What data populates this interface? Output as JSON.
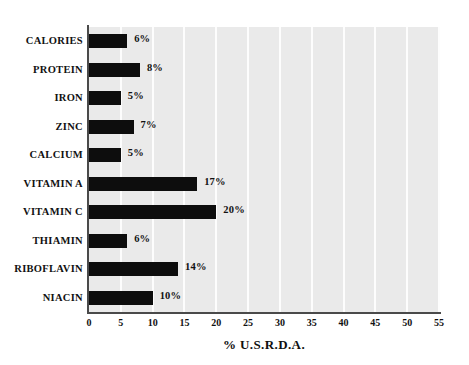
{
  "chart_data": {
    "type": "bar",
    "orientation": "horizontal",
    "title": "",
    "xlabel": "% U.S.R.D.A.",
    "ylabel": "",
    "xlim": [
      0,
      55
    ],
    "xticks": [
      "0",
      "5",
      "10",
      "15",
      "20",
      "25",
      "30",
      "35",
      "40",
      "45",
      "50",
      "55"
    ],
    "xtick_values": [
      0,
      5,
      10,
      15,
      20,
      25,
      30,
      35,
      40,
      45,
      50,
      55
    ],
    "grid": true,
    "grid_axis": "x",
    "legend": false,
    "categories": [
      "CALORIES",
      "PROTEIN",
      "IRON",
      "ZINC",
      "CALCIUM",
      "VITAMIN A",
      "VITAMIN C",
      "THIAMIN",
      "RIBOFLAVIN",
      "NIACIN"
    ],
    "values": [
      6,
      8,
      5,
      7,
      5,
      17,
      20,
      6,
      14,
      10
    ],
    "data_labels": [
      "6%",
      "8%",
      "5%",
      "7%",
      "5%",
      "17%",
      "20%",
      "6%",
      "14%",
      "10%"
    ],
    "bar_color": "#0d0d0d",
    "plot_background": "#eaeaea",
    "gridline_color": "#fdfdfd",
    "axis_color": "#4a4a4a",
    "page_background": "#ffffff"
  }
}
